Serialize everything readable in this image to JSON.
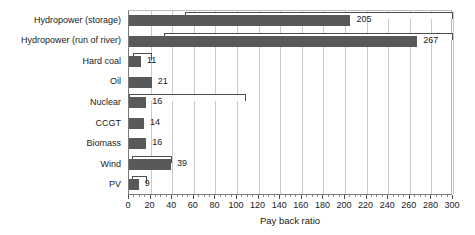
{
  "chart_data": {
    "type": "bar",
    "orientation": "horizontal",
    "title": "",
    "xlabel": "Pay back ratio",
    "ylabel": "",
    "xlim": [
      0,
      300
    ],
    "xticks": [
      0,
      20,
      40,
      60,
      80,
      100,
      120,
      140,
      160,
      180,
      200,
      220,
      240,
      260,
      280,
      300
    ],
    "xtick_labels": [
      "0",
      "20",
      "40",
      "60",
      "80",
      "100",
      "120",
      "140",
      "160",
      "180",
      "200",
      "220",
      "240",
      "260",
      "280",
      "300"
    ],
    "minor_tick_step": 5,
    "grid": true,
    "grid_axis": "x",
    "legend": null,
    "bar_color": "#595959",
    "range_color": "#4d4d4d",
    "categories": [
      "Hydropower (storage)",
      "Hydropower (run of river)",
      "Hard coal",
      "Oil",
      "Nuclear",
      "CCGT",
      "Biomass",
      "Wind",
      "PV"
    ],
    "values": [
      205,
      267,
      11,
      21,
      16,
      14,
      16,
      39,
      9
    ],
    "value_labels": [
      "205",
      "267",
      "11",
      "21",
      "16",
      "14",
      "16",
      "39",
      "9"
    ],
    "ranges": [
      {
        "low": 52,
        "high": 310
      },
      {
        "low": 32,
        "high": 309
      },
      {
        "low": 4,
        "high": 21
      },
      null,
      {
        "low": 0,
        "high": 108
      },
      null,
      null,
      {
        "low": 3,
        "high": 40
      },
      {
        "low": 3,
        "high": 17
      }
    ],
    "bars": [
      {
        "category": "Hydropower (storage)",
        "value": 205,
        "label": "205",
        "range_low": 52,
        "range_high": 310
      },
      {
        "category": "Hydropower (run of river)",
        "value": 267,
        "label": "267",
        "range_low": 32,
        "range_high": 309
      },
      {
        "category": "Hard coal",
        "value": 11,
        "label": "11",
        "range_low": 4,
        "range_high": 21
      },
      {
        "category": "Oil",
        "value": 21,
        "label": "21",
        "range_low": null,
        "range_high": null
      },
      {
        "category": "Nuclear",
        "value": 16,
        "label": "16",
        "range_low": 0,
        "range_high": 108
      },
      {
        "category": "CCGT",
        "value": 14,
        "label": "14",
        "range_low": null,
        "range_high": null
      },
      {
        "category": "Biomass",
        "value": 16,
        "label": "16",
        "range_low": null,
        "range_high": null
      },
      {
        "category": "Wind",
        "value": 39,
        "label": "39",
        "range_low": 3,
        "range_high": 40
      },
      {
        "category": "PV",
        "value": 9,
        "label": "9",
        "range_low": 3,
        "range_high": 17
      }
    ]
  }
}
